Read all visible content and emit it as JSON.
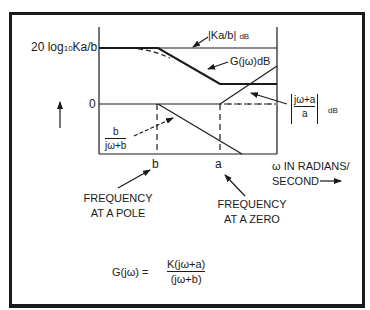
{
  "figure": {
    "y_axis": {
      "top_label": "20 log10Ka/b",
      "top_label_main": "20 log",
      "top_label_sub": "10",
      "top_label_end": "Ka/b",
      "zero_label": "0"
    },
    "x_axis": {
      "tick_b": "b",
      "tick_a": "a",
      "label_line1": "ω IN RADIANS/",
      "label_line2": "SECOND"
    },
    "curve_labels": {
      "ka_b": "|Ka/b|",
      "ka_b_unit": "dB",
      "g_jw": "G(jω)dB",
      "zero_term_num": "jω+a",
      "zero_term_den": "a",
      "zero_term_unit": "dB",
      "pole_term_num": "b",
      "pole_term_den": "jω+b"
    },
    "annotations": {
      "pole_line1": "FREQUENCY",
      "pole_line2": "AT A POLE",
      "zero_line1": "FREQUENCY",
      "zero_line2": "AT A ZERO"
    },
    "equation": {
      "lhs": "G(jω) =",
      "numerator": "K(jω+a)",
      "denominator": "(jω+b)"
    },
    "colors": {
      "ink": "#1a1a1a",
      "background": "#ffffff"
    }
  }
}
